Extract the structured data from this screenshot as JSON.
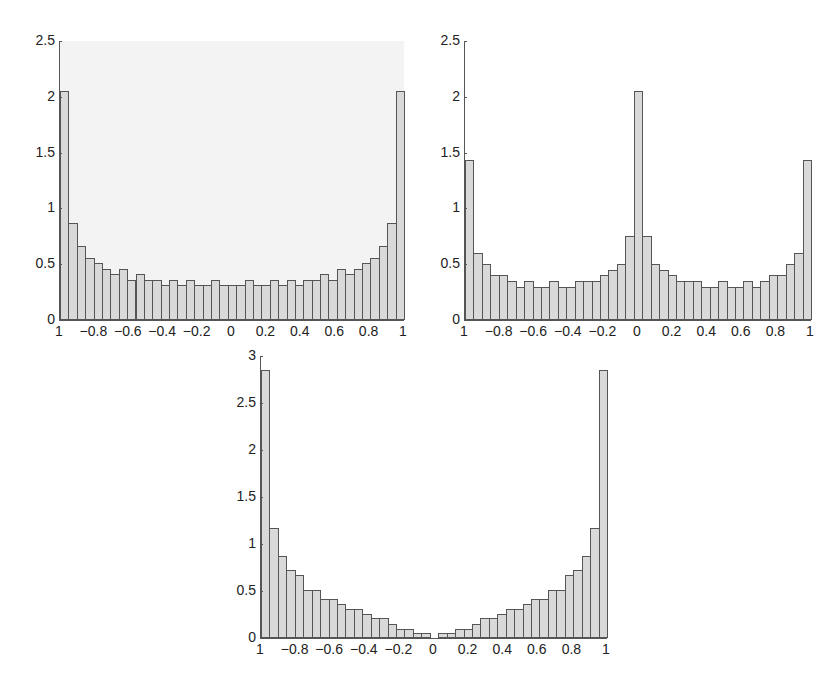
{
  "chart_data": [
    {
      "type": "bar",
      "title": "",
      "xlabel": "",
      "ylabel": "",
      "xlim": [
        -1,
        1
      ],
      "ylim": [
        0,
        2.5
      ],
      "yticks": [
        "0",
        "0.5",
        "1",
        "1.5",
        "2",
        "2.5"
      ],
      "xticks": [
        "1",
        "−0.8",
        "−0.6",
        "−0.4",
        "−0.2",
        "0",
        "0.2",
        "0.4",
        "0.6",
        "0.8",
        "1"
      ],
      "grid": false,
      "bins": 41,
      "values": [
        2.05,
        0.87,
        0.66,
        0.56,
        0.51,
        0.46,
        0.41,
        0.46,
        0.36,
        0.41,
        0.36,
        0.36,
        0.31,
        0.36,
        0.31,
        0.36,
        0.31,
        0.31,
        0.36,
        0.31,
        0.31,
        0.31,
        0.36,
        0.31,
        0.31,
        0.36,
        0.31,
        0.36,
        0.31,
        0.36,
        0.36,
        0.41,
        0.36,
        0.46,
        0.41,
        0.46,
        0.51,
        0.56,
        0.66,
        0.87,
        2.05
      ]
    },
    {
      "type": "bar",
      "title": "",
      "xlabel": "",
      "ylabel": "",
      "xlim": [
        -1,
        1
      ],
      "ylim": [
        0,
        2.5
      ],
      "yticks": [
        "0",
        "0.5",
        "1",
        "1.5",
        "2",
        "2.5"
      ],
      "xticks": [
        "1",
        "−0.8",
        "−0.6",
        "−0.4",
        "−0.2",
        "0",
        "0.2",
        "0.4",
        "0.6",
        "0.8",
        "1"
      ],
      "grid": false,
      "bins": 41,
      "values": [
        1.43,
        0.6,
        0.5,
        0.4,
        0.4,
        0.35,
        0.3,
        0.35,
        0.3,
        0.3,
        0.35,
        0.3,
        0.3,
        0.35,
        0.35,
        0.35,
        0.4,
        0.45,
        0.5,
        0.75,
        2.05,
        0.75,
        0.5,
        0.45,
        0.4,
        0.35,
        0.35,
        0.35,
        0.3,
        0.3,
        0.35,
        0.3,
        0.3,
        0.35,
        0.3,
        0.35,
        0.4,
        0.4,
        0.5,
        0.6,
        1.43
      ]
    },
    {
      "type": "bar",
      "title": "",
      "xlabel": "",
      "ylabel": "",
      "xlim": [
        -1,
        1
      ],
      "ylim": [
        0,
        3
      ],
      "yticks": [
        "0",
        "0.5",
        "1",
        "1.5",
        "2",
        "2.5",
        "3"
      ],
      "xticks": [
        "1",
        "−0.8",
        "−0.6",
        "−0.4",
        "−0.2",
        "0",
        "0.2",
        "0.4",
        "0.6",
        "0.8",
        "1"
      ],
      "grid": false,
      "bins": 41,
      "values": [
        2.85,
        1.17,
        0.87,
        0.72,
        0.67,
        0.51,
        0.51,
        0.41,
        0.41,
        0.36,
        0.31,
        0.31,
        0.26,
        0.21,
        0.21,
        0.15,
        0.1,
        0.1,
        0.05,
        0.05,
        0,
        0.05,
        0.05,
        0.1,
        0.1,
        0.15,
        0.21,
        0.21,
        0.26,
        0.31,
        0.31,
        0.36,
        0.41,
        0.41,
        0.51,
        0.51,
        0.67,
        0.72,
        0.87,
        1.17,
        2.85
      ]
    }
  ],
  "layout": [
    {
      "left": 59,
      "top": 41,
      "width": 344,
      "height": 279,
      "tinted": true
    },
    {
      "left": 464,
      "top": 41,
      "width": 346,
      "height": 279,
      "tinted": false
    },
    {
      "left": 260,
      "top": 356,
      "width": 346,
      "height": 282,
      "tinted": false
    }
  ]
}
